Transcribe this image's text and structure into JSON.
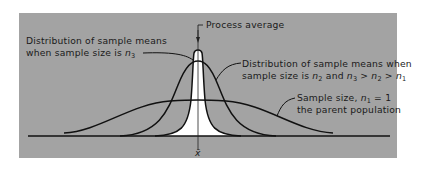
{
  "diagram": {
    "background_color": "#a3a3a3",
    "labels": {
      "process_average": "Process average",
      "n3_line1": "Distribution of sample means",
      "n3_line2": "when sample size is ",
      "n3_var": "n",
      "n3_sub": "3",
      "n2_line1": "Distribution of sample means when",
      "n2_line2_a": "sample size is ",
      "n2_var": "n",
      "n2_sub": "2",
      "n2_line2_b": " and ",
      "n2_rel": "n3 > n2 > n1",
      "n1_line1_a": "Sample size, ",
      "n1_var": "n",
      "n1_sub": "1",
      "n1_line1_b": " = 1",
      "n1_line2": "the parent population",
      "axis_mean": "x̄"
    },
    "curves": [
      {
        "name": "parent-population",
        "sample_size": "n1 = 1",
        "width": "widest"
      },
      {
        "name": "sample-means-n2",
        "sample_size": "n2",
        "width": "medium"
      },
      {
        "name": "sample-means-n3",
        "sample_size": "n3",
        "width": "narrowest",
        "fill": "#ffffff"
      }
    ]
  }
}
